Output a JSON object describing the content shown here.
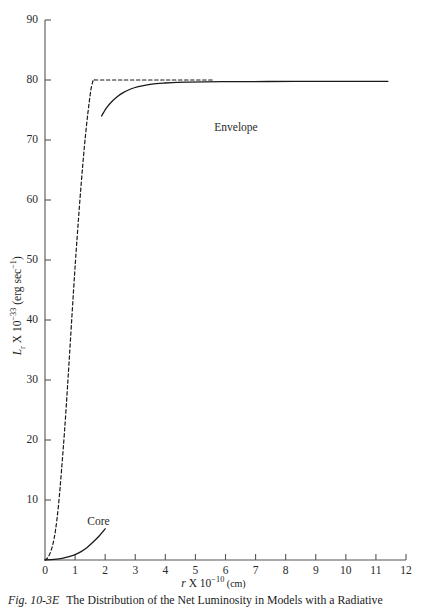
{
  "chart_data": {
    "type": "line",
    "title": "",
    "xlabel": "r X 10^-10 (cm)",
    "ylabel": "L_r X 10^-33 (erg sec^-1)",
    "xlim": [
      0,
      12
    ],
    "ylim": [
      0,
      90
    ],
    "grid": false,
    "legend_position": "inline-annotations",
    "xticks": [
      "0",
      "1",
      "2",
      "3",
      "4",
      "5",
      "6",
      "7",
      "8",
      "9",
      "10",
      "11",
      "12"
    ],
    "yticks": [
      "10",
      "20",
      "30",
      "40",
      "50",
      "60",
      "70",
      "80",
      "90"
    ],
    "series": [
      {
        "name": "Envelope",
        "style": "solid",
        "annotation": "Envelope",
        "annotation_x": 6.35,
        "annotation_y": 72.0,
        "x": [
          1.88,
          1.95,
          2.05,
          2.2,
          2.4,
          2.6,
          2.85,
          3.1,
          3.4,
          3.7,
          4.0,
          4.4,
          4.8,
          5.3,
          5.9,
          6.6,
          7.4,
          8.3,
          9.3,
          10.3,
          11.4
        ],
        "y": [
          74.0,
          74.6,
          75.4,
          76.3,
          77.2,
          77.9,
          78.5,
          78.9,
          79.2,
          79.4,
          79.5,
          79.6,
          79.65,
          79.7,
          79.72,
          79.74,
          79.75,
          79.76,
          79.77,
          79.78,
          79.78
        ]
      },
      {
        "name": "Core",
        "style": "solid",
        "annotation": "Core",
        "annotation_x": 1.78,
        "annotation_y": 6.4,
        "x": [
          0.0,
          0.2,
          0.4,
          0.6,
          0.8,
          1.0,
          1.2,
          1.4,
          1.6,
          1.8,
          2.0
        ],
        "y": [
          0.0,
          0.05,
          0.15,
          0.3,
          0.55,
          0.9,
          1.4,
          2.1,
          3.0,
          4.0,
          5.2
        ]
      },
      {
        "name": "Model (dashed)",
        "style": "dashed",
        "annotation": "",
        "x": [
          0.0,
          0.12,
          0.25,
          0.35,
          0.45,
          0.55,
          0.65,
          0.75,
          0.85,
          0.95,
          1.05,
          1.2,
          1.35,
          1.5,
          1.58,
          1.62,
          1.7,
          2.5,
          4.0,
          5.6
        ],
        "y": [
          0.0,
          0.6,
          2.4,
          5.0,
          9.2,
          15.0,
          21.5,
          29.0,
          37.0,
          45.0,
          52.5,
          62.5,
          71.0,
          77.5,
          79.6,
          80.0,
          80.0,
          80.0,
          80.0,
          80.0
        ]
      }
    ]
  },
  "axis": {
    "x_title_var": "r",
    "x_title_times": " X 10",
    "x_title_exp": "−10",
    "x_title_unit": " (cm)",
    "y_title_var": "L",
    "y_title_sub": "r",
    "y_title_times": " X 10",
    "y_title_exp": "−33",
    "y_title_unit_open": " (erg sec",
    "y_title_unit_exp": "−1",
    "y_title_unit_close": ")"
  },
  "caption": {
    "figure_number": "Fig. 10-3E",
    "text": "The Distribution of the Net Luminosity in Models with a Radiative"
  },
  "colors": {
    "axis": "#3a3a3a",
    "curve": "#1a1a1a",
    "text": "#1a1a1a",
    "background": "#ffffff"
  }
}
